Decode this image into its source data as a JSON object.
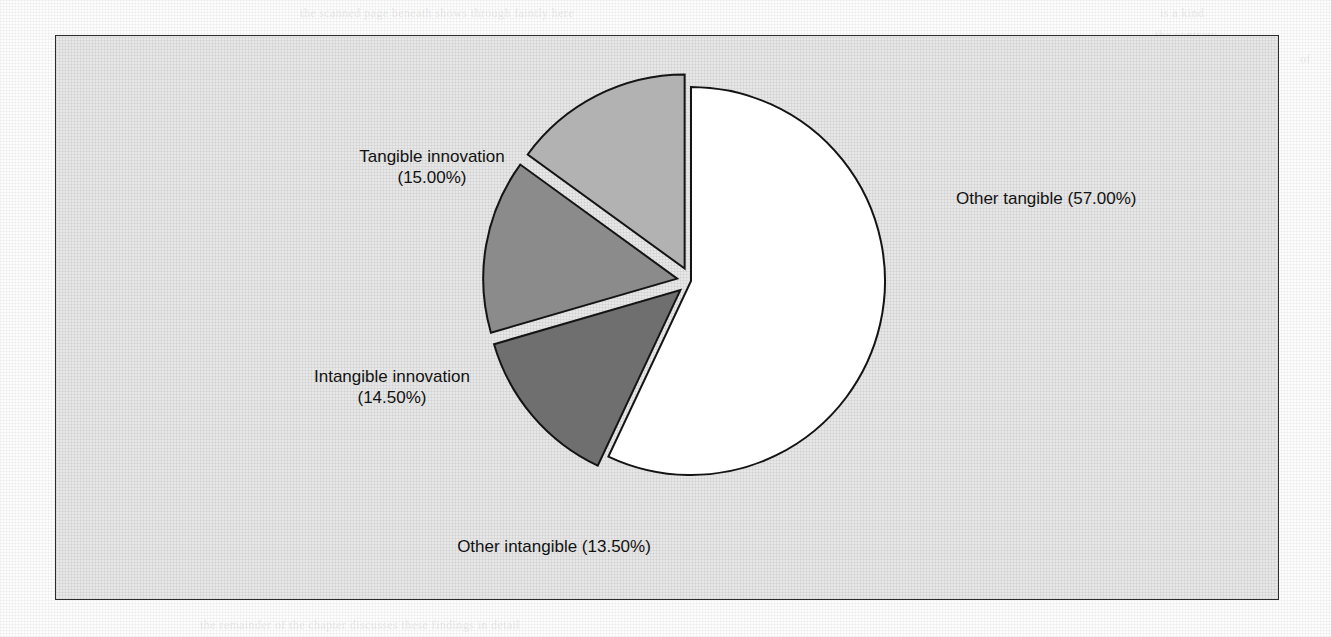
{
  "page": {
    "background_color": "#fdfdfd",
    "frame_fill": "#e7e7e7",
    "frame_border_color": "#2b2b2b"
  },
  "chart_data": {
    "type": "pie",
    "title": "",
    "subtitle": "",
    "xlabel": "",
    "ylabel": "",
    "legend_position": "none",
    "grid": false,
    "units": "percent",
    "total": 100.0,
    "start_angle_deg": 0,
    "direction": "clockwise",
    "categories": [
      "Other tangible",
      "Other intangible",
      "Intangible innovation",
      "Tangible innovation"
    ],
    "values": [
      57.0,
      13.5,
      14.5,
      15.0
    ],
    "slices": [
      {
        "name": "other-tangible",
        "label": "Other tangible",
        "value": 57.0,
        "value_text": "(57.00%)",
        "display": "Other tangible (57.00%)",
        "color": "#ffffff",
        "exploded": false,
        "label_lines": [
          "Other tangible (57.00%)"
        ]
      },
      {
        "name": "other-intangible",
        "label": "Other intangible",
        "value": 13.5,
        "value_text": "(13.50%)",
        "display": "Other intangible (13.50%)",
        "color": "#6f6f6f",
        "exploded": true,
        "label_lines": [
          "Other intangible (13.50%)"
        ]
      },
      {
        "name": "intangible-innovation",
        "label": "Intangible innovation",
        "value": 14.5,
        "value_text": "(14.50%)",
        "display": "Intangible innovation (14.50%)",
        "color": "#8b8b8b",
        "exploded": true,
        "label_lines": [
          "Intangible innovation",
          "(14.50%)"
        ]
      },
      {
        "name": "tangible-innovation",
        "label": "Tangible innovation",
        "value": 15.0,
        "value_text": "(15.00%)",
        "display": "Tangible innovation (15.00%)",
        "color": "#b2b2b2",
        "exploded": true,
        "label_lines": [
          "Tangible innovation",
          "(15.00%)"
        ]
      }
    ],
    "geometry": {
      "center_x": 635,
      "center_y": 245,
      "radius": 194,
      "explode_offset": 14,
      "stroke_color": "#141414",
      "stroke_width": 2
    }
  },
  "labels": {
    "tangible_innovation_line1": "Tangible innovation",
    "tangible_innovation_line2": "(15.00%)",
    "intangible_innovation_line1": "Intangible innovation",
    "intangible_innovation_line2": "(14.50%)",
    "other_intangible_line1": "Other intangible (13.50%)",
    "other_tangible_line1": "Other tangible (57.00%)"
  }
}
